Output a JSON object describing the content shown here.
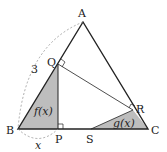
{
  "diagram": {
    "points": {
      "A": {
        "label": "A",
        "x": 83,
        "y": 22
      },
      "B": {
        "label": "B",
        "x": 18,
        "y": 129
      },
      "C": {
        "label": "C",
        "x": 148,
        "y": 129
      },
      "Q": {
        "label": "Q",
        "x": 58,
        "y": 64
      },
      "P": {
        "label": "P",
        "x": 58,
        "y": 129
      },
      "R": {
        "label": "R",
        "x": 133,
        "y": 110
      },
      "S": {
        "label": "S",
        "x": 91,
        "y": 129
      }
    },
    "side_label_AB": "3",
    "side_label_BP": "x",
    "region_f": "f(x)",
    "region_g": "g(x)",
    "colors": {
      "stroke": "#222222",
      "shade": "#bdbdbd",
      "dashed": "#888888"
    }
  }
}
